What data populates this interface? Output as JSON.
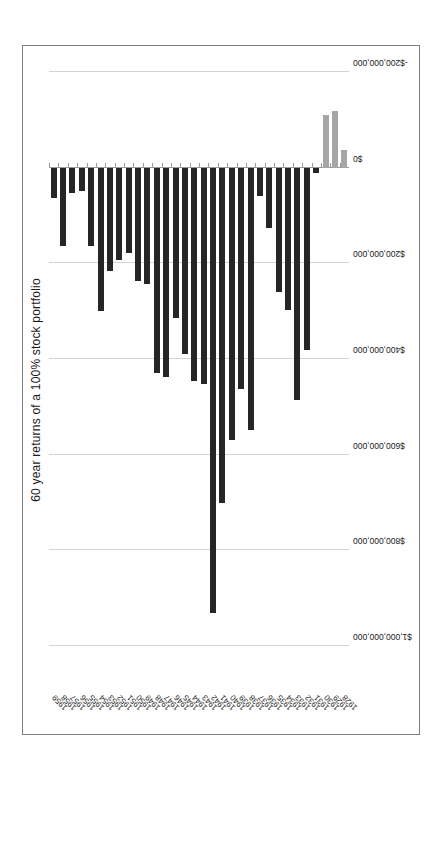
{
  "chart_data": {
    "type": "bar",
    "orientation": "horizontal",
    "title": "60 year returns of a 100% stock portfolio",
    "xlabel": "",
    "ylabel": "",
    "grid": true,
    "legend": false,
    "xlim": [
      -200000000,
      1100000000
    ],
    "axis_tick_labels": [
      "$1,000,000,000",
      "$800,000,000",
      "$600,000,000",
      "$400,000,000",
      "$200,000,000",
      "$0",
      "-$200,000,000"
    ],
    "axis_tick_values": [
      1000000000,
      800000000,
      600000000,
      400000000,
      200000000,
      0,
      -200000000
    ],
    "categories": [
      "1928",
      "1929",
      "1930",
      "1931",
      "1932",
      "1933",
      "1934",
      "1935",
      "1936",
      "1937",
      "1938",
      "1939",
      "1940",
      "1941",
      "1942",
      "1943",
      "1944",
      "1945",
      "1946",
      "1947",
      "1948",
      "1949",
      "1950",
      "1951",
      "1952",
      "1953",
      "1954",
      "1955",
      "1956",
      "1957",
      "1958",
      "1959"
    ],
    "values": [
      -37000000,
      -118000000,
      -111000000,
      11000000,
      381000000,
      485000000,
      298000000,
      259000000,
      126000000,
      59000000,
      548000000,
      463000000,
      570000000,
      700000000,
      930000000,
      452000000,
      445000000,
      389000000,
      315000000,
      437000000,
      430000000,
      244000000,
      237000000,
      178000000,
      193000000,
      215000000,
      300000000,
      163000000,
      48000000,
      52000000,
      163000000,
      63000000
    ],
    "colors": {
      "positive_bar": "#262626",
      "negative_bar": "#a6a6a6",
      "gridline": "#d4d4d4",
      "border": "#7f7f7f",
      "text": "#1a1a1a",
      "background": "#ffffff"
    }
  }
}
